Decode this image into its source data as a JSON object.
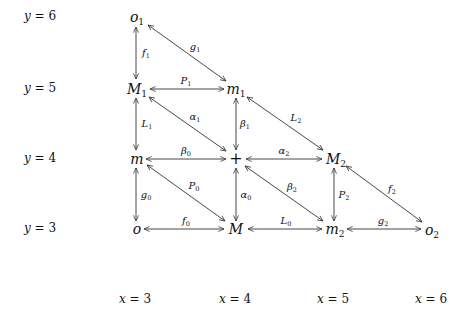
{
  "row_labels": [
    {
      "var": "y",
      "eq": "=",
      "val": "6",
      "top": 10
    },
    {
      "var": "y",
      "eq": "=",
      "val": "5",
      "top": 82
    },
    {
      "var": "y",
      "eq": "=",
      "val": "4",
      "top": 152
    },
    {
      "var": "y",
      "eq": "=",
      "val": "3",
      "top": 222
    }
  ],
  "col_labels": [
    {
      "var": "x",
      "eq": "=",
      "val": "3",
      "left": 119
    },
    {
      "var": "x",
      "eq": "=",
      "val": "4",
      "left": 219
    },
    {
      "var": "x",
      "eq": "=",
      "val": "5",
      "left": 317
    },
    {
      "var": "x",
      "eq": "=",
      "val": "6",
      "left": 415
    }
  ],
  "nodes": {
    "o1": {
      "base": "o",
      "sub": "1",
      "x": 137,
      "y": 17
    },
    "M1": {
      "base": "M",
      "sub": "1",
      "x": 137,
      "y": 89
    },
    "m1": {
      "base": "m",
      "sub": "1",
      "x": 236,
      "y": 89
    },
    "m": {
      "base": "m",
      "sub": "",
      "x": 137,
      "y": 159
    },
    "plus": {
      "base": "+",
      "sub": "",
      "x": 236,
      "y": 159
    },
    "M2": {
      "base": "M",
      "sub": "2",
      "x": 336,
      "y": 159
    },
    "o": {
      "base": "o",
      "sub": "",
      "x": 137,
      "y": 229
    },
    "M": {
      "base": "M",
      "sub": "",
      "x": 236,
      "y": 229
    },
    "m2": {
      "base": "m",
      "sub": "2",
      "x": 335,
      "y": 229
    },
    "o2": {
      "base": "o",
      "sub": "2",
      "x": 432,
      "y": 230
    }
  },
  "edges": [
    {
      "name": "f1",
      "base": "f",
      "sub": "1",
      "x1": 136,
      "y1": 27,
      "x2": 136,
      "y2": 79,
      "lx": 146,
      "ly": 53
    },
    {
      "name": "g1",
      "base": "g",
      "sub": "1",
      "x1": 148,
      "y1": 25,
      "x2": 226,
      "y2": 81,
      "lx": 195,
      "ly": 47
    },
    {
      "name": "P1",
      "base": "P",
      "sub": "1",
      "x1": 150,
      "y1": 89,
      "x2": 224,
      "y2": 89,
      "lx": 186,
      "ly": 81
    },
    {
      "name": "L1",
      "base": "L",
      "sub": "1",
      "x1": 136,
      "y1": 98,
      "x2": 136,
      "y2": 150,
      "lx": 147,
      "ly": 124
    },
    {
      "name": "alpha1",
      "base": "α",
      "sub": "1",
      "x1": 149,
      "y1": 97,
      "x2": 226,
      "y2": 151,
      "lx": 195,
      "ly": 117
    },
    {
      "name": "beta1",
      "base": "β",
      "sub": "1",
      "x1": 236,
      "y1": 98,
      "x2": 236,
      "y2": 150,
      "lx": 245,
      "ly": 124
    },
    {
      "name": "L2",
      "base": "L",
      "sub": "2",
      "x1": 247,
      "y1": 97,
      "x2": 323,
      "y2": 150,
      "lx": 296,
      "ly": 118
    },
    {
      "name": "beta0",
      "base": "β",
      "sub": "0",
      "x1": 146,
      "y1": 159,
      "x2": 226,
      "y2": 159,
      "lx": 186,
      "ly": 151
    },
    {
      "name": "alpha2",
      "base": "α",
      "sub": "2",
      "x1": 246,
      "y1": 159,
      "x2": 322,
      "y2": 159,
      "lx": 284,
      "ly": 151
    },
    {
      "name": "g0",
      "base": "g",
      "sub": "0",
      "x1": 136,
      "y1": 168,
      "x2": 136,
      "y2": 221,
      "lx": 146,
      "ly": 195
    },
    {
      "name": "P0",
      "base": "P",
      "sub": "0",
      "x1": 147,
      "y1": 165,
      "x2": 225,
      "y2": 221,
      "lx": 194,
      "ly": 186
    },
    {
      "name": "alpha0",
      "base": "α",
      "sub": "0",
      "x1": 236,
      "y1": 168,
      "x2": 236,
      "y2": 221,
      "lx": 246,
      "ly": 195
    },
    {
      "name": "beta2",
      "base": "β",
      "sub": "2",
      "x1": 245,
      "y1": 166,
      "x2": 323,
      "y2": 221,
      "lx": 292,
      "ly": 187
    },
    {
      "name": "P2",
      "base": "P",
      "sub": "2",
      "x1": 334,
      "y1": 168,
      "x2": 334,
      "y2": 221,
      "lx": 344,
      "ly": 195
    },
    {
      "name": "f2",
      "base": "f",
      "sub": "2",
      "x1": 346,
      "y1": 166,
      "x2": 422,
      "y2": 222,
      "lx": 392,
      "ly": 189
    },
    {
      "name": "f0",
      "base": "f",
      "sub": "0",
      "x1": 144,
      "y1": 229,
      "x2": 224,
      "y2": 229,
      "lx": 186,
      "ly": 221
    },
    {
      "name": "L0",
      "base": "L",
      "sub": "0",
      "x1": 248,
      "y1": 229,
      "x2": 322,
      "y2": 229,
      "lx": 286,
      "ly": 221
    },
    {
      "name": "g2",
      "base": "g",
      "sub": "2",
      "x1": 347,
      "y1": 229,
      "x2": 421,
      "y2": 229,
      "lx": 383,
      "ly": 221
    }
  ],
  "colors": {
    "line": "#333333",
    "text": "#111111",
    "background": "#ffffff"
  }
}
